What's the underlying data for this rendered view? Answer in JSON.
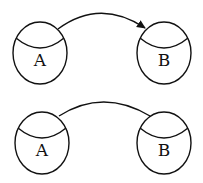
{
  "diagrams": [
    {
      "name": "directed",
      "nodes": [
        {
          "label": "A"
        },
        {
          "label": "B"
        }
      ],
      "edge": {
        "directed": true
      }
    },
    {
      "name": "undirected",
      "nodes": [
        {
          "label": "A"
        },
        {
          "label": "B"
        }
      ],
      "edge": {
        "directed": false
      }
    }
  ],
  "colors": {
    "stroke": "#111111",
    "background": "#ffffff"
  }
}
